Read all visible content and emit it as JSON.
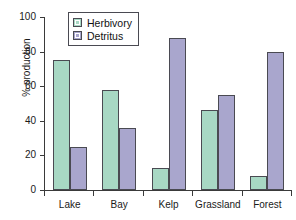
{
  "chart_data": {
    "type": "bar",
    "title": "",
    "subtitle": "",
    "xlabel": "",
    "ylabel": "% production",
    "ylim": [
      0,
      100
    ],
    "yticks": [
      0,
      20,
      40,
      60,
      80,
      100
    ],
    "ytick_labels": [
      "0",
      "20",
      "40",
      "60",
      "80",
      "100"
    ],
    "grid": false,
    "legend_position": "top-left-inside",
    "categories": [
      "Lake",
      "Bay",
      "Kelp",
      "Grassland",
      "Forest"
    ],
    "series": [
      {
        "name": "Herbivory",
        "color": "#a8d8c4",
        "values": [
          75,
          58,
          13,
          46,
          8
        ]
      },
      {
        "name": "Detritus",
        "color": "#a9a6cd",
        "values": [
          25,
          36,
          88,
          55,
          80
        ]
      }
    ],
    "annotations": []
  },
  "axis": {
    "line_color": "#3a3a3a",
    "bar_edge_color": "#4a4a52"
  }
}
